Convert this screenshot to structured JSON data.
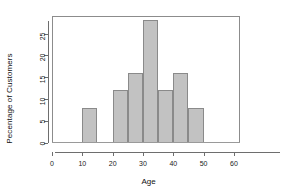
{
  "chart_data": {
    "type": "bar",
    "title": "",
    "subtitle": "",
    "xlabel": "Age",
    "ylabel": "Pecentage of Customers",
    "xlim": [
      0,
      62
    ],
    "ylim": [
      0,
      29
    ],
    "grid": false,
    "legend": null,
    "bin_width": 5,
    "xticks": [
      0,
      10,
      20,
      30,
      40,
      50,
      60
    ],
    "xtick_labels": [
      "0",
      "10",
      "20",
      "30",
      "40",
      "50",
      "60"
    ],
    "yticks": [
      0,
      5,
      10,
      15,
      20,
      25
    ],
    "ytick_labels": [
      "0",
      "5",
      "10",
      "15",
      "20",
      "25"
    ],
    "bar_color": "#c2c2c2",
    "bar_edge_color": "#8a8a8a",
    "axis_color": "#6e6e6e",
    "bins": [
      {
        "label": "10-15",
        "x0": 10,
        "x1": 15,
        "value": 8
      },
      {
        "label": "20-25",
        "x0": 20,
        "x1": 25,
        "value": 12
      },
      {
        "label": "25-30",
        "x0": 25,
        "x1": 30,
        "value": 16
      },
      {
        "label": "30-35",
        "x0": 30,
        "x1": 35,
        "value": 28
      },
      {
        "label": "35-40",
        "x0": 35,
        "x1": 40,
        "value": 12
      },
      {
        "label": "40-45",
        "x0": 40,
        "x1": 45,
        "value": 16
      },
      {
        "label": "45-50",
        "x0": 45,
        "x1": 50,
        "value": 8
      }
    ],
    "categories": [
      "10-15",
      "20-25",
      "25-30",
      "30-35",
      "35-40",
      "40-45",
      "45-50"
    ],
    "values": [
      8,
      12,
      16,
      28,
      12,
      16,
      8
    ]
  }
}
